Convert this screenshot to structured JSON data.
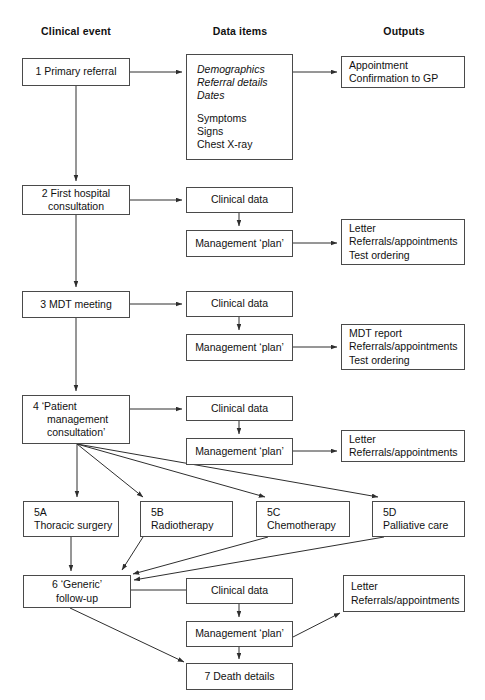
{
  "diagram": {
    "title_columns": [
      {
        "key": "clinical_event",
        "label": "Clinical event"
      },
      {
        "key": "data_items",
        "label": "Data items"
      },
      {
        "key": "outputs",
        "label": "Outputs"
      }
    ],
    "stroke_color": "#4a4a4a",
    "text_color": "#111111",
    "background_color": "#ffffff"
  },
  "nodes": {
    "step1": {
      "label": "1 Primary referral"
    },
    "step1_data": {
      "items_italic": [
        "Demographics",
        "Referral details",
        "Dates"
      ],
      "items_plain": [
        "Symptoms",
        "Signs",
        "Chest X-ray"
      ]
    },
    "step1_output": {
      "line1": "Appointment",
      "line2": "Confirmation to GP"
    },
    "step2": {
      "line1": "2 First hospital",
      "line2": "consultation"
    },
    "step2_clinical": {
      "label": "Clinical data"
    },
    "step2_plan": {
      "label": "Management ‘plan’"
    },
    "step2_output": {
      "line1": "Letter",
      "line2": "Referrals/appointments",
      "line3": "Test ordering"
    },
    "step3": {
      "label": "3 MDT meeting"
    },
    "step3_clinical": {
      "label": "Clinical data"
    },
    "step3_plan": {
      "label": "Management ‘plan’"
    },
    "step3_output": {
      "line1": "MDT report",
      "line2": "Referrals/appointments",
      "line3": "Test ordering"
    },
    "step4": {
      "line1": "4 ‘Patient",
      "line2": "management",
      "line3": "consultation’"
    },
    "step4_clinical": {
      "label": "Clinical data"
    },
    "step4_plan": {
      "label": "Management ‘plan’"
    },
    "step4_output": {
      "line1": "Letter",
      "line2": "Referrals/appointments"
    },
    "step5a": {
      "line1": "5A",
      "line2": "Thoracic surgery"
    },
    "step5b": {
      "line1": "5B",
      "line2": "Radiotherapy"
    },
    "step5c": {
      "line1": "5C",
      "line2": "Chemotherapy"
    },
    "step5d": {
      "line1": "5D",
      "line2": "Palliative care"
    },
    "step6": {
      "line1": "6 ‘Generic’",
      "line2": "follow-up"
    },
    "step6_clinical": {
      "label": "Clinical data"
    },
    "step6_plan": {
      "label": "Management ‘plan’"
    },
    "step6_output": {
      "line1": "Letter",
      "line2": "Referrals/appointments"
    },
    "step7": {
      "label": "7 Death details"
    }
  }
}
